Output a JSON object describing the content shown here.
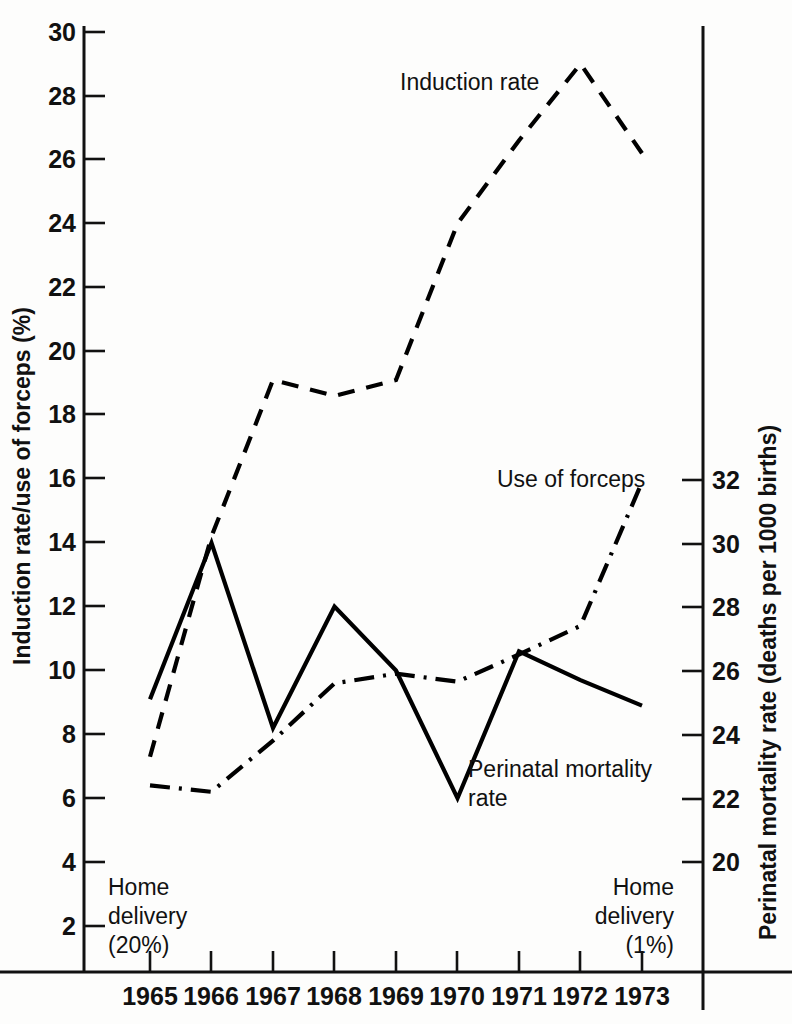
{
  "chart_data": {
    "type": "line",
    "title": "",
    "xlabel": "",
    "ylabel": "Induction rate/use of forceps (%)",
    "y2label": "Perinatal mortality rate (deaths per 1000 births)",
    "grid": false,
    "legend_position": "inline-annotations",
    "categories": [
      "1965",
      "1966",
      "1967",
      "1968",
      "1969",
      "1970",
      "1971",
      "1972",
      "1973"
    ],
    "x": [
      1965,
      1966,
      1967,
      1968,
      1969,
      1970,
      1971,
      1972,
      1973
    ],
    "ylim": [
      2,
      30
    ],
    "yticks": [
      2,
      4,
      6,
      8,
      10,
      12,
      14,
      16,
      18,
      20,
      22,
      24,
      26,
      28,
      30
    ],
    "y2lim": [
      19,
      33
    ],
    "y2ticks": [
      20,
      22,
      24,
      26,
      28,
      30,
      32
    ],
    "series": [
      {
        "name": "Induction rate",
        "axis": "left",
        "style": "dashed",
        "unit": "%",
        "values": [
          7.3,
          14.2,
          19.1,
          18.6,
          19.1,
          24.0,
          26.6,
          29.0,
          26.2
        ]
      },
      {
        "name": "Use of forceps",
        "axis": "left",
        "style": "dash-dot",
        "unit": "%",
        "values": [
          6.4,
          6.2,
          7.8,
          9.6,
          9.9,
          9.65,
          10.5,
          11.4,
          15.9
        ]
      },
      {
        "name": "Perinatal mortality rate",
        "axis": "right",
        "style": "solid",
        "unit": "deaths per 1000 births",
        "values_left_scale": [
          9.1,
          14.0,
          8.2,
          12.0,
          10.0,
          6.0,
          10.6,
          9.7,
          8.9
        ],
        "values": [
          25.4,
          30.0,
          24.8,
          27.9,
          26.1,
          22.0,
          26.5,
          25.5,
          25.0
        ]
      }
    ],
    "annotations": [
      {
        "text": "Induction rate",
        "x": 1969.5,
        "y": 27.7
      },
      {
        "text": "Use of forceps",
        "x": 1971.2,
        "y": 16.0
      },
      {
        "text": "Perinatal mortality",
        "x": 1970.3,
        "y": 6.4
      },
      {
        "text": "rate",
        "x": 1970.3,
        "y": 5.35
      },
      {
        "text": "Home",
        "x": 1965.05,
        "y": 2.6
      },
      {
        "text": "delivery",
        "x": 1965.05,
        "y": 1.65
      },
      {
        "text": "(20%)",
        "x": 1965.05,
        "y": 0.7
      },
      {
        "text": "Home",
        "x": 1972.6,
        "y": 2.6
      },
      {
        "text": "delivery",
        "x": 1972.6,
        "y": 1.65
      },
      {
        "text": "(1%)",
        "x": 1972.6,
        "y": 0.7
      }
    ]
  },
  "axes": {
    "left_title": "Induction rate/use of forceps (%)",
    "right_title": "Perinatal mortality rate (deaths per 1000 births)",
    "left_ticks": [
      "30",
      "28",
      "26",
      "24",
      "22",
      "20",
      "18",
      "16",
      "14",
      "12",
      "10",
      "8",
      "6",
      "4",
      "2"
    ],
    "right_ticks": [
      "32",
      "30",
      "28",
      "26",
      "24",
      "22",
      "20"
    ],
    "x_ticks": [
      "1965",
      "1966",
      "1967",
      "1968",
      "1969",
      "1970",
      "1971",
      "1972",
      "1973"
    ]
  },
  "labels": {
    "induction_rate": "Induction rate",
    "use_of_forceps": "Use of forceps",
    "perinatal_line1": "Perinatal mortality",
    "perinatal_line2": "rate",
    "home_left_line1": "Home",
    "home_left_line2": "delivery",
    "home_left_line3": "(20%)",
    "home_right_line1": "Home",
    "home_right_line2": "delivery",
    "home_right_line3": "(1%)"
  },
  "colors": {
    "ink": "#111111",
    "background": "#fdfdfc"
  }
}
